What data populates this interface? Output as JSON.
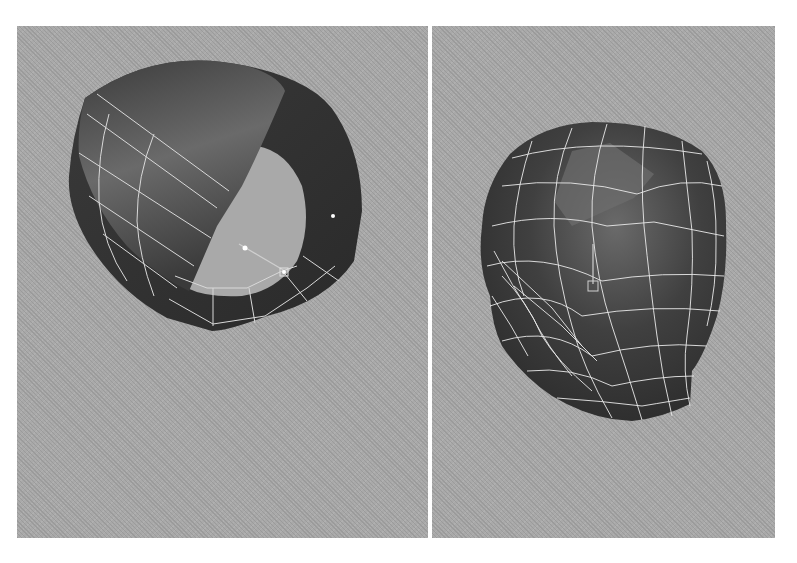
{
  "figure": {
    "panels": [
      {
        "id": "left",
        "subject": "cylinder-ring-mesh",
        "description": "Perspective viewport: open cylinder/ring polygon mesh with partially extruded shaded cap, wireframe edges on left band"
      },
      {
        "id": "right",
        "subject": "head-mesh",
        "description": "Perspective viewport: low-poly human head mesh with white wireframe and selected face (move manipulator)"
      }
    ],
    "colors": {
      "viewport_bg": "#a9a9a9",
      "mesh_dark": "#303030",
      "mesh_mid": "#5a5a5a",
      "wire": "#e8e8e8",
      "divider": "#ffffff"
    }
  }
}
